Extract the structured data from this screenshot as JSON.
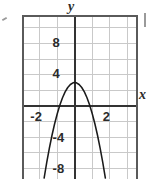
{
  "figure": {
    "width": 147,
    "height": 179,
    "background": "#ffffff",
    "frame_color": "#5a5a5a",
    "grid_color": "#c8c8c8",
    "axis_color": "#333333",
    "curve_color": "#1a1a1a"
  },
  "labels": {
    "y_axis_name": "y",
    "x_axis_name": "x"
  },
  "artifacts": {
    "left_mark": "",
    "right_mark": ""
  },
  "chart_data": {
    "type": "line",
    "title": "",
    "xlabel": "x",
    "ylabel": "y",
    "grid": true,
    "legend": "none",
    "xlim": [
      -2.9,
      3.5
    ],
    "ylim": [
      -10.4,
      11.4
    ],
    "x_ticks": [
      -2,
      2
    ],
    "x_tick_labels": [
      "-2",
      "2"
    ],
    "y_ticks": [
      8,
      4,
      -4,
      -8
    ],
    "y_tick_labels": [
      "8",
      "4",
      "-4",
      "-8"
    ],
    "x_grid_step": 1,
    "y_grid_step": 2,
    "equation": "y = 3 - 4x^2",
    "vertex": [
      0,
      3
    ],
    "opens": "down",
    "roots": [
      -0.87,
      0.87
    ],
    "x": [
      -1.75,
      -1.6,
      -1.45,
      -1.3,
      -1.15,
      -1.0,
      -0.85,
      -0.7,
      -0.55,
      -0.4,
      -0.25,
      -0.1,
      0,
      0.1,
      0.25,
      0.4,
      0.55,
      0.7,
      0.85,
      1.0,
      1.15,
      1.3,
      1.45,
      1.6,
      1.75
    ],
    "y": [
      -9.25,
      -7.24,
      -5.41,
      -3.76,
      -2.29,
      -1.0,
      0.11,
      1.04,
      1.79,
      2.36,
      2.75,
      2.96,
      3.0,
      2.96,
      2.75,
      2.36,
      1.79,
      1.04,
      0.11,
      -1.0,
      -2.29,
      -3.76,
      -5.41,
      -7.24,
      -9.25
    ]
  }
}
